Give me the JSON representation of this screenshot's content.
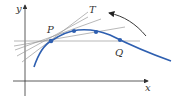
{
  "diagram": {
    "labels": {
      "y_axis": "y",
      "x_axis": "x",
      "point_p": "P",
      "point_q": "Q",
      "tangent": "T"
    },
    "colors": {
      "curve": "#2e5fb0",
      "points": "#2e5fb0",
      "lines": "#9a9a9a",
      "axes": "#333333",
      "arrow": "#222222"
    }
  }
}
